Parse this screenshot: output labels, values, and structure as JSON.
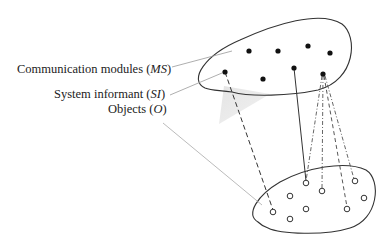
{
  "labels": {
    "ms": {
      "text": "Communication modules (",
      "abbr": "MS",
      "close": ")"
    },
    "si": {
      "text": "System informant (",
      "abbr": "SI",
      "close": ")"
    },
    "objects": {
      "text": "Objects (",
      "abbr": "O",
      "close": ")"
    }
  },
  "diagram": {
    "top_region": "communication-modules-set",
    "bottom_region": "objects-set",
    "top_dots": 8,
    "bottom_circles": 9
  }
}
